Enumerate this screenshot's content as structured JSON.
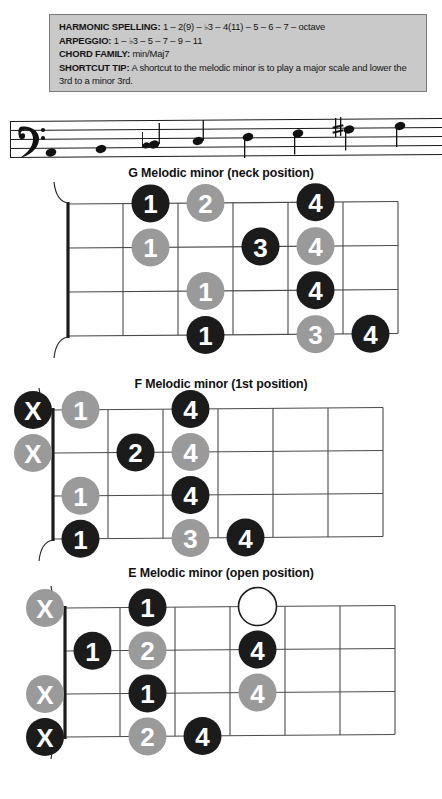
{
  "info_box": {
    "lines": [
      {
        "label": "HARMONIC SPELLING:",
        "text": " 1 – 2(9) – ♭3 – 4(11) – 5 – 6 – 7 – octave"
      },
      {
        "label": "ARPEGGIO:",
        "text": " 1 – ♭3 – 5 – 7 – 9 – 11"
      },
      {
        "label": "CHORD FAMILY:",
        "text": " min/Maj7"
      },
      {
        "label": "SHORTCUT TIP:",
        "text": " A shortcut to the melodic minor is to play a major scale and lower the 3rd to a minor 3rd."
      }
    ]
  },
  "staff": {
    "clef": "bass-clef",
    "accidentals": [
      "flat-on-note-3",
      "sharp-on-note-7"
    ],
    "note_count": 8
  },
  "diagrams": [
    {
      "title": "G Melodic minor (neck position)",
      "frets": 6,
      "strings": 4,
      "has_nut": true,
      "markers": [],
      "dots": [
        {
          "string": 1,
          "fret": 2,
          "label": "1",
          "color": "black"
        },
        {
          "string": 1,
          "fret": 3,
          "label": "2",
          "color": "gray"
        },
        {
          "string": 1,
          "fret": 5,
          "label": "4",
          "color": "black"
        },
        {
          "string": 2,
          "fret": 2,
          "label": "1",
          "color": "gray"
        },
        {
          "string": 2,
          "fret": 4,
          "label": "3",
          "color": "black"
        },
        {
          "string": 2,
          "fret": 5,
          "label": "4",
          "color": "gray"
        },
        {
          "string": 3,
          "fret": 3,
          "label": "1",
          "color": "gray"
        },
        {
          "string": 3,
          "fret": 5,
          "label": "4",
          "color": "black"
        },
        {
          "string": 4,
          "fret": 3,
          "label": "1",
          "color": "black"
        },
        {
          "string": 4,
          "fret": 5,
          "label": "3",
          "color": "gray"
        },
        {
          "string": 4,
          "fret": 6,
          "label": "4",
          "color": "black"
        }
      ]
    },
    {
      "title": "F Melodic minor (1st position)",
      "frets": 6,
      "strings": 4,
      "has_nut": true,
      "markers": [
        {
          "string": 1,
          "label": "X",
          "color": "black"
        },
        {
          "string": 2,
          "label": "X",
          "color": "gray"
        }
      ],
      "dots": [
        {
          "string": 1,
          "fret": 1,
          "label": "1",
          "color": "gray"
        },
        {
          "string": 1,
          "fret": 3,
          "label": "4",
          "color": "black"
        },
        {
          "string": 2,
          "fret": 2,
          "label": "2",
          "color": "black"
        },
        {
          "string": 2,
          "fret": 3,
          "label": "4",
          "color": "gray"
        },
        {
          "string": 3,
          "fret": 1,
          "label": "1",
          "color": "gray"
        },
        {
          "string": 3,
          "fret": 3,
          "label": "4",
          "color": "black"
        },
        {
          "string": 4,
          "fret": 1,
          "label": "1",
          "color": "black"
        },
        {
          "string": 4,
          "fret": 3,
          "label": "3",
          "color": "gray"
        },
        {
          "string": 4,
          "fret": 4,
          "label": "4",
          "color": "black"
        }
      ]
    },
    {
      "title": "E Melodic minor (open position)",
      "frets": 6,
      "strings": 4,
      "has_nut": true,
      "markers": [
        {
          "string": 1,
          "label": "X",
          "color": "gray"
        },
        {
          "string": 3,
          "label": "X",
          "color": "gray"
        },
        {
          "string": 4,
          "label": "X",
          "color": "black"
        }
      ],
      "dots": [
        {
          "string": 1,
          "fret": 2,
          "label": "1",
          "color": "black"
        },
        {
          "string": 1,
          "fret": 4,
          "label": "",
          "color": "open"
        },
        {
          "string": 2,
          "fret": 1,
          "label": "1",
          "color": "black"
        },
        {
          "string": 2,
          "fret": 2,
          "label": "2",
          "color": "gray"
        },
        {
          "string": 2,
          "fret": 4,
          "label": "4",
          "color": "black"
        },
        {
          "string": 3,
          "fret": 2,
          "label": "1",
          "color": "black"
        },
        {
          "string": 3,
          "fret": 4,
          "label": "4",
          "color": "gray"
        },
        {
          "string": 4,
          "fret": 2,
          "label": "2",
          "color": "gray"
        },
        {
          "string": 4,
          "fret": 3,
          "label": "4",
          "color": "black"
        }
      ]
    }
  ],
  "colors": {
    "box_bg": "#c9c9c9",
    "box_border": "#7a7a7a",
    "dot_black": "#1b1b1b",
    "dot_gray": "#9a9a9a",
    "grid": "#4a4a4a"
  }
}
